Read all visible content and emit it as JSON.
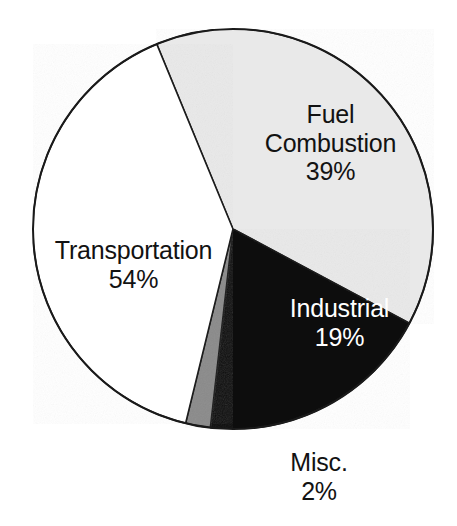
{
  "chart_data": {
    "type": "pie",
    "title": "",
    "subtitle": "",
    "xlabel": "",
    "ylabel": "",
    "legend_position": "none",
    "grid": false,
    "labels_inside": true,
    "unit": "%",
    "categories": [
      "Fuel Combustion",
      "Transportation",
      "Industrial",
      "Misc."
    ],
    "values": [
      39,
      54,
      19,
      2
    ],
    "slices": [
      {
        "name": "Fuel Combustion",
        "label": "Fuel Combustion",
        "label_line1": "Fuel",
        "label_line2": "Combustion",
        "value": 39,
        "value_text": "39%",
        "color": "#e9e9e9",
        "text_color": "#121212",
        "start_angle_deg": 337.6,
        "sweep_deg": 140.5
      },
      {
        "name": "Industrial",
        "label": "Industrial",
        "label_line1": "Industrial",
        "label_line2": "",
        "value": 19,
        "value_text": "19%",
        "color": "#0d0d0d",
        "text_color": "#ffffff",
        "start_angle_deg": 118.1,
        "sweep_deg": 68.4
      },
      {
        "name": "Misc.",
        "label": "Misc.",
        "label_line1": "Misc.",
        "label_line2": "",
        "value": 2,
        "value_text": "2%",
        "color": "#8a8a8a",
        "text_color": "#121212",
        "start_angle_deg": 186.5,
        "sweep_deg": 7.2
      },
      {
        "name": "Transportation",
        "label": "Transportation",
        "label_line1": "Transportation",
        "label_line2": "",
        "value": 54,
        "value_text": "54%",
        "color": "#ffffff",
        "text_color": "#121212",
        "start_angle_deg": 193.7,
        "sweep_deg": 143.9
      }
    ],
    "geometry": {
      "center_x": 233,
      "center_y": 229,
      "radius": 200,
      "outline_color": "#1a1a1a",
      "outline_width": 2
    },
    "background_color": "#ffffff"
  }
}
